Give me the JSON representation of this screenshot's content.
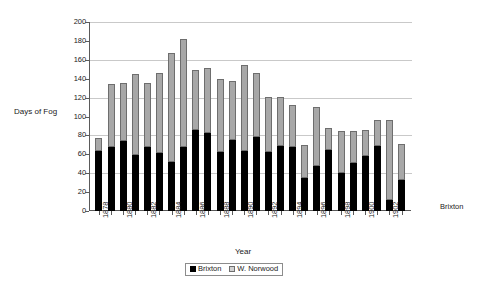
{
  "chart_data": {
    "type": "bar",
    "subtype": "stacked",
    "title": "",
    "xlabel": "Year",
    "ylabel": "Days of Fog",
    "ylim": [
      0,
      200
    ],
    "ytick_step": 20,
    "yticks": [
      0,
      20,
      40,
      60,
      80,
      100,
      120,
      140,
      160,
      180,
      200
    ],
    "grid": true,
    "grid_axis": "y",
    "legend_position": "bottom-center",
    "categories": [
      "1878",
      "1879",
      "1880",
      "1881",
      "1882",
      "1883",
      "1884",
      "1885",
      "1886",
      "1887",
      "1888",
      "1889",
      "1890",
      "1891",
      "1892",
      "1893",
      "1894",
      "1895",
      "1896",
      "1897",
      "1898",
      "1899",
      "1900",
      "1901",
      "1902",
      "1903"
    ],
    "xtick_labels_shown": [
      "1878",
      "1880",
      "1882",
      "1884",
      "1886",
      "1888",
      "1890",
      "1892",
      "1894",
      "1896",
      "1898",
      "1900",
      "1902"
    ],
    "series": [
      {
        "name": "Brixton",
        "color": "#000000",
        "values": [
          63,
          68,
          74,
          59,
          68,
          61,
          52,
          68,
          86,
          83,
          62,
          75,
          64,
          78,
          62,
          69,
          68,
          35,
          48,
          65,
          40,
          51,
          58,
          69,
          12,
          33
        ]
      },
      {
        "name": "W. Norwood",
        "color": "#a8a8a8",
        "values": [
          14,
          66,
          62,
          86,
          68,
          85,
          115,
          114,
          63,
          68,
          78,
          63,
          90,
          68,
          59,
          52,
          44,
          35,
          62,
          23,
          45,
          34,
          28,
          27,
          84,
          38
        ]
      }
    ],
    "totals": [
      77,
      134,
      136,
      145,
      136,
      146,
      167,
      182,
      149,
      151,
      140,
      138,
      154,
      146,
      121,
      121,
      112,
      70,
      110,
      88,
      85,
      85,
      86,
      96,
      96,
      71
    ],
    "annotations": [
      {
        "text": "Brixton",
        "position": "right-of-plot"
      }
    ]
  },
  "axes": {
    "y_title": "Days of Fog",
    "x_title": "Year"
  },
  "legend": {
    "entries": [
      {
        "label": "Brixton",
        "swatch": "black-square"
      },
      {
        "label": "W. Norwood",
        "swatch": "gray-square"
      }
    ]
  }
}
